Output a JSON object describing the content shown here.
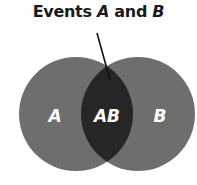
{
  "title": {
    "prefix": "Events ",
    "event_a": "A",
    "conjunction": " and ",
    "event_b": "B"
  },
  "regions": {
    "a_only": {
      "label": "A"
    },
    "intersection": {
      "label": "AB"
    },
    "b_only": {
      "label": "B"
    }
  },
  "colors": {
    "circle_fill": "#6e6e6e",
    "intersection_fill": "#262626",
    "label": "#ffffff",
    "pointer": "#111111",
    "title": "#1a1a1a"
  }
}
